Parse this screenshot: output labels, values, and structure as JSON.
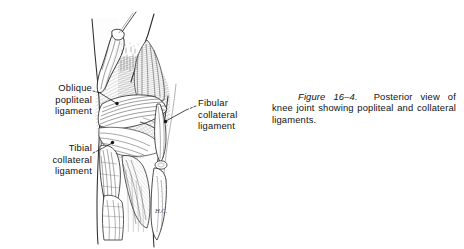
{
  "document": {
    "type": "anatomy-textbook-figure",
    "background_color": "#ffffff",
    "ink_color": "#111111"
  },
  "labels": [
    {
      "id": "oblique-popliteal",
      "text": "Oblique\npopliteal\nligament",
      "align": "right",
      "leader": "dashed-line-to-right"
    },
    {
      "id": "tibial-collateral",
      "text": "Tibial\ncollateral\nligament",
      "align": "right",
      "leader": "line-to-upper-right"
    },
    {
      "id": "fibular-collateral",
      "text": "Fibular\ncollateral\nligament",
      "align": "left",
      "leader": "line-to-lower-left"
    }
  ],
  "caption": {
    "number": "Figure 16–4.",
    "body": "Posterior view of knee joint showing popliteal and collateral ligaments."
  },
  "illustration": {
    "name": "posterior-view-of-knee-joint",
    "description": "Line drawing of the posterior aspect of a right knee joint showing the femoral condyles, oblique popliteal ligament, tibial and fibular collateral ligaments, tibia and fibula.",
    "artist_initials": "H.C."
  }
}
